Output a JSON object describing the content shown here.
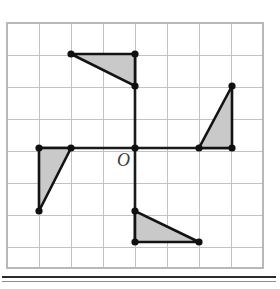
{
  "figure": {
    "label_origin": "O",
    "colors": {
      "triangle_fill": "#c9c9c9",
      "triangle_stroke": "#131313",
      "axis": "#1a1a1a",
      "grid_line": "#c0c2c8",
      "grid_border": "#b6b8be",
      "vertex_dot": "#101010",
      "origin_label": "#3b3b3b",
      "page_rule": "#2b2b2b",
      "background": "#ffffff"
    }
  },
  "chart_data": {
    "type": "scatter",
    "title": "",
    "subtitle": "",
    "xlabel": "",
    "ylabel": "",
    "grid": true,
    "legend": null,
    "axis_labels_visible": false,
    "tick_labels": [],
    "origin_label": "O",
    "grid_geometry": {
      "cell_size_px": 32,
      "columns": 8,
      "rows": 7.65,
      "left_px": 7,
      "top_px": 23,
      "right_px": 263,
      "bottom_px": 268,
      "origin_px": {
        "x": 135,
        "y": 148
      },
      "xlim": [
        -4,
        4
      ],
      "ylim": [
        -2.9,
        3.9
      ]
    },
    "axes": [
      {
        "name": "horizontal-axis",
        "from_units": [
          -3,
          0
        ],
        "to_units": [
          3,
          0
        ],
        "from_px": [
          39,
          148
        ],
        "to_px": [
          232,
          148
        ]
      },
      {
        "name": "vertical-axis",
        "from_units": [
          0,
          3
        ],
        "to_units": [
          0,
          -3
        ],
        "from_px": [
          135,
          54
        ],
        "to_px": [
          135,
          242
        ]
      }
    ],
    "series": [
      {
        "name": "top-triangle",
        "right_angle_at_units": [
          0,
          3
        ],
        "vertices_units": [
          [
            -2,
            3
          ],
          [
            0,
            3
          ],
          [
            0,
            2
          ]
        ],
        "vertices_px": [
          [
            71,
            54
          ],
          [
            135,
            54
          ],
          [
            135,
            86
          ]
        ],
        "legs_units": [
          2,
          1
        ]
      },
      {
        "name": "right-triangle",
        "right_angle_at_units": [
          3,
          0
        ],
        "vertices_units": [
          [
            3,
            2
          ],
          [
            3,
            0
          ],
          [
            2,
            0
          ]
        ],
        "vertices_px": [
          [
            232,
            86
          ],
          [
            232,
            148
          ],
          [
            199,
            148
          ]
        ],
        "legs_units": [
          2,
          1
        ]
      },
      {
        "name": "bottom-triangle",
        "right_angle_at_units": [
          0,
          -3
        ],
        "vertices_units": [
          [
            0,
            -2
          ],
          [
            0,
            -3
          ],
          [
            2,
            -3
          ]
        ],
        "vertices_px": [
          [
            135,
            211
          ],
          [
            135,
            242
          ],
          [
            199,
            242
          ]
        ],
        "legs_units": [
          2,
          1
        ]
      },
      {
        "name": "left-triangle",
        "right_angle_at_units": [
          -3,
          0
        ],
        "vertices_units": [
          [
            -3,
            0
          ],
          [
            -2,
            0
          ],
          [
            -3,
            -2
          ]
        ],
        "vertices_px": [
          [
            39,
            148
          ],
          [
            71,
            148
          ],
          [
            39,
            211
          ]
        ],
        "legs_units": [
          2,
          1
        ]
      }
    ],
    "vertex_points_units": [
      [
        -2,
        3
      ],
      [
        0,
        3
      ],
      [
        0,
        2
      ],
      [
        3,
        2
      ],
      [
        3,
        0
      ],
      [
        2,
        0
      ],
      [
        0,
        -2
      ],
      [
        0,
        -3
      ],
      [
        2,
        -3
      ],
      [
        -3,
        0
      ],
      [
        -2,
        0
      ],
      [
        -3,
        -2
      ],
      [
        0,
        0
      ]
    ],
    "vertex_points_px": [
      [
        71,
        54
      ],
      [
        135,
        54
      ],
      [
        135,
        86
      ],
      [
        232,
        86
      ],
      [
        232,
        148
      ],
      [
        199,
        148
      ],
      [
        135,
        211
      ],
      [
        135,
        242
      ],
      [
        199,
        242
      ],
      [
        39,
        148
      ],
      [
        71,
        148
      ],
      [
        39,
        211
      ],
      [
        135,
        148
      ]
    ]
  }
}
